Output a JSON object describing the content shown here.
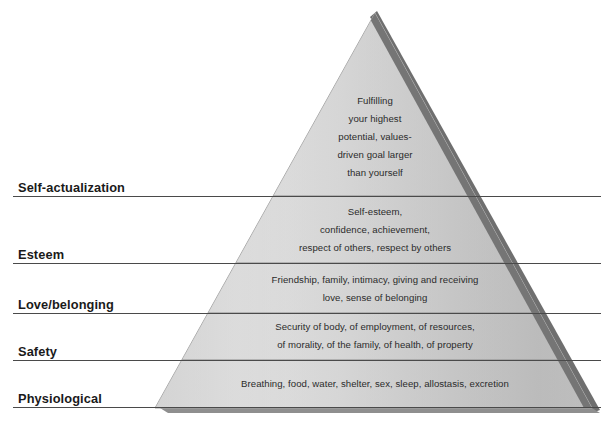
{
  "diagram": {
    "type": "pyramid",
    "name": "maslow-hierarchy-of-needs",
    "colors": {
      "pyramid_light": "#dedede",
      "pyramid_mid": "#c9c9c9",
      "pyramid_dark": "#b0b0b0",
      "edge_shadow": "#6f6f6f",
      "base_shadow": "#8c8c8c",
      "divider": "#8a8a8a",
      "leader_line": "#4a4a4a",
      "label_text": "#1a1a1a",
      "body_text": "#2b2b2b",
      "background": "#ffffff"
    },
    "tiers": [
      {
        "id": "self-actualization",
        "label": "Self-actualization",
        "lines": [
          "Fulfilling",
          "your highest",
          "potential, values-",
          "driven goal larger",
          "than yourself"
        ]
      },
      {
        "id": "esteem",
        "label": "Esteem",
        "lines": [
          "Self-esteem,",
          "confidence, achievement,",
          "respect of others, respect by others"
        ]
      },
      {
        "id": "love-belonging",
        "label": "Love/belonging",
        "lines": [
          "Friendship, family, intimacy, giving and receiving",
          "love, sense of belonging"
        ]
      },
      {
        "id": "safety",
        "label": "Safety",
        "lines": [
          "Security of body, of employment, of resources,",
          "of morality, of the family, of health, of property"
        ]
      },
      {
        "id": "physiological",
        "label": "Physiological",
        "lines": [
          "Breathing, food, water, shelter, sex, sleep, allostasis, excretion"
        ]
      }
    ]
  }
}
